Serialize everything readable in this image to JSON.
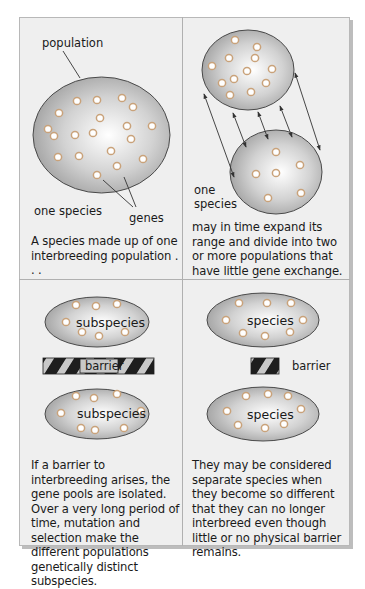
{
  "figure": {
    "colors": {
      "frame_bg": "#efefef",
      "frame_border": "#b8b8b8",
      "divider": "#b0b0b0",
      "ellipse_center": "#ffffff",
      "ellipse_edge": "#9d9d9d",
      "ellipse_outline": "#4a4a4a",
      "gene_ring": "#c9a27a",
      "gene_fill": "#ffffff",
      "barrier_dark": "#1e1e1e",
      "barrier_light": "#c8c8c8",
      "text": "#1a1a1a"
    },
    "panels": [
      {
        "id": "panel-1",
        "labels": {
          "population": "population",
          "species": "one species",
          "genes": "genes"
        },
        "caption": "A species made up of one interbreeding population . . ."
      },
      {
        "id": "panel-2",
        "labels": {
          "species_line1": "one",
          "species_line2": "species"
        },
        "caption": "may in time expand its range and divide into two or more populations that have little gene exchange."
      },
      {
        "id": "panel-3",
        "labels": {
          "top": "subspecies",
          "barrier": "barrier",
          "bottom": "subspecies"
        },
        "caption": "If a barrier to interbreeding arises, the gene pools are isolated. Over a very long period of time, mutation and selection make the different populations genetically distinct subspecies."
      },
      {
        "id": "panel-4",
        "labels": {
          "top": "species",
          "barrier": "barrier",
          "bottom": "species"
        },
        "caption": "They may be considered separate species when they become so different that they can no longer interbreed even though little or no physical barrier remains."
      }
    ]
  }
}
